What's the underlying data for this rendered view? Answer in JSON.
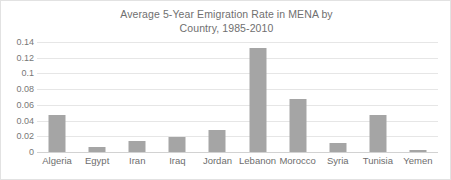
{
  "chart_data": {
    "type": "bar",
    "title": "Average 5-Year Emigration Rate in MENA by\nCountry, 1985-2010",
    "xlabel": "",
    "ylabel": "",
    "ylim": [
      0,
      0.14
    ],
    "yticks": [
      "0",
      "0.02",
      "0.04",
      "0.06",
      "0.08",
      "0.1",
      "0.12",
      "0.14"
    ],
    "ytick_values": [
      0,
      0.02,
      0.04,
      0.06,
      0.08,
      0.1,
      0.12,
      0.14
    ],
    "grid": true,
    "legend": false,
    "bar_color": "#a5a5a5",
    "categories": [
      "Algeria",
      "Egypt",
      "Iran",
      "Iraq",
      "Jordan",
      "Lebanon",
      "Morocco",
      "Syria",
      "Tunisia",
      "Yemen"
    ],
    "values": [
      0.047,
      0.006,
      0.0145,
      0.019,
      0.028,
      0.132,
      0.067,
      0.011,
      0.047,
      0.002
    ]
  }
}
